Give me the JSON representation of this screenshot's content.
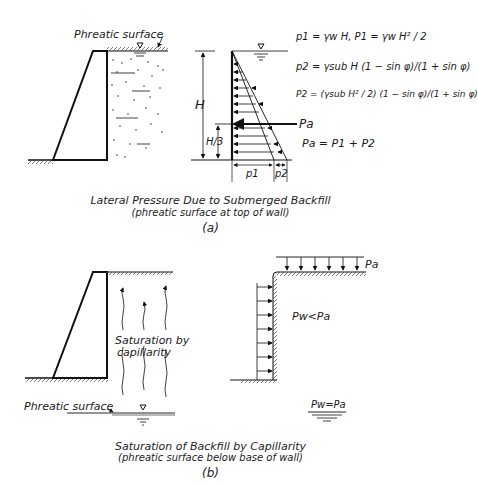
{
  "panel_a": {
    "phreatic_label": "Phreatic surface",
    "H_label": "H",
    "H3_label": "H/3",
    "p1_label": "p1",
    "p2_label": "p2",
    "Pa_label": "Pa",
    "formula_1": "p1 = γw H,  P1 = γw H² / 2",
    "formula_2": "p2 = γsub H (1 − sin φ)/(1 + sin φ)",
    "formula_3": "P2 = (γsub H² / 2) (1 − sin φ)/(1 + sin φ)",
    "formula_4": "Pa = P1 + P2",
    "caption_title": "Lateral Pressure Due to Submerged Backfill",
    "caption_sub": "(phreatic surface at top of wall)",
    "caption_tag": "(a)"
  },
  "panel_b": {
    "saturation_label_1": "Saturation by",
    "saturation_label_2": "capillarity",
    "phreatic_label": "Phreatic surface",
    "Pa_label": "Pa",
    "pw_lt_pa": "Pw<Pa",
    "pw_eq_pa": "Pw=Pa",
    "caption_title": "Saturation of Backfill by Capillarity",
    "caption_sub": "(phreatic surface below base of wall)",
    "caption_tag": "(b)"
  }
}
